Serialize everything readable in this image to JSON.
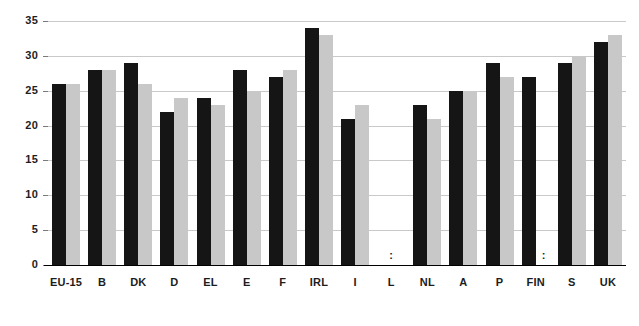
{
  "chart_data": {
    "type": "bar",
    "title": "",
    "subtitle": "",
    "xlabel": "",
    "ylabel": "",
    "ylim": [
      0,
      35
    ],
    "yticks": [
      0,
      5,
      10,
      15,
      20,
      25,
      30,
      35
    ],
    "ytick_labels": [
      "0",
      "5",
      "10",
      "15",
      "20",
      "25",
      "30",
      "35"
    ],
    "grid": true,
    "legend": "none",
    "missing_value_marker": ":",
    "categories": [
      "EU-15",
      "B",
      "DK",
      "D",
      "EL",
      "E",
      "F",
      "IRL",
      "I",
      "L",
      "NL",
      "A",
      "P",
      "FIN",
      "S",
      "UK"
    ],
    "series": [
      {
        "name": "series-1",
        "color": "#151515",
        "values": [
          26,
          28,
          29,
          22,
          24,
          28,
          27,
          34,
          21,
          null,
          23,
          25,
          29,
          27,
          29,
          32
        ]
      },
      {
        "name": "series-2",
        "color": "#c8c8c8",
        "values": [
          26,
          28,
          26,
          24,
          23,
          25,
          28,
          33,
          23,
          null,
          21,
          25,
          27,
          null,
          30,
          33
        ]
      }
    ]
  },
  "colors": {
    "series_1": "#151515",
    "series_2": "#c8c8c8",
    "gridline": "#c9c9c9",
    "axis": "#000000",
    "text": "#1d1d1d",
    "background": "#ffffff"
  }
}
